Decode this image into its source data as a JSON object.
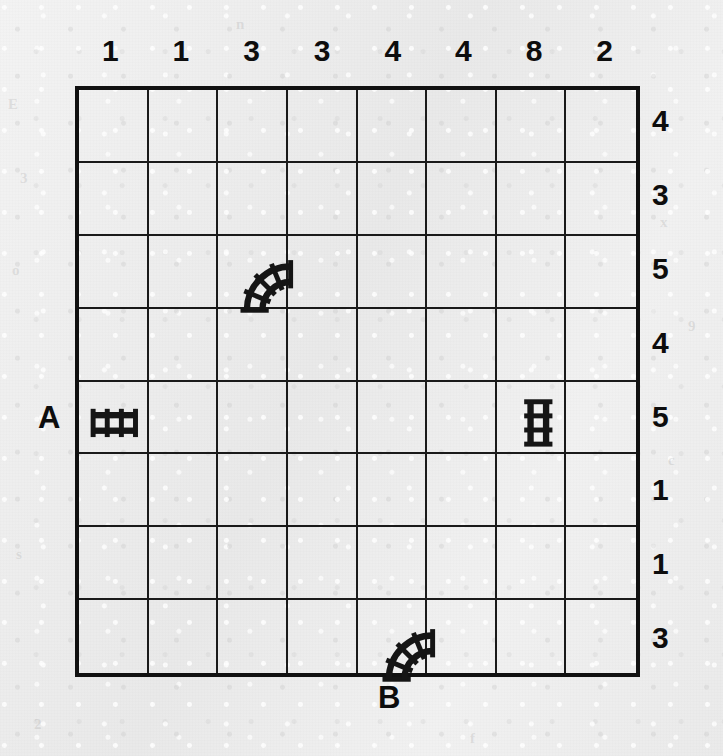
{
  "puzzle": {
    "type": "train-tracks",
    "grid": {
      "rows": 8,
      "cols": 8
    },
    "column_clues": [
      1,
      1,
      3,
      3,
      4,
      4,
      8,
      2
    ],
    "row_clues": [
      4,
      3,
      5,
      4,
      5,
      1,
      1,
      3
    ],
    "entry_labels": [
      {
        "id": "A",
        "text": "A",
        "side": "left",
        "row": 5
      },
      {
        "id": "B",
        "text": "B",
        "side": "bottom",
        "col": 5
      }
    ],
    "given_tracks": [
      {
        "row": 3,
        "col": 3,
        "kind": "curve",
        "connects": [
          "right",
          "bottom"
        ]
      },
      {
        "row": 5,
        "col": 1,
        "kind": "straight",
        "connects": [
          "left",
          "right"
        ],
        "orientation": "horizontal"
      },
      {
        "row": 5,
        "col": 7,
        "kind": "straight",
        "connects": [
          "top",
          "bottom"
        ],
        "orientation": "vertical"
      },
      {
        "row": 8,
        "col": 5,
        "kind": "curve",
        "connects": [
          "right",
          "bottom"
        ]
      }
    ],
    "colors": {
      "paper": "#eeeeee",
      "ink": "#111111",
      "gridline": "#1a1a1a",
      "track": "#151515"
    },
    "ghost_marks": [
      {
        "text": "E",
        "x": 8,
        "y": 96
      },
      {
        "text": "3",
        "x": 20,
        "y": 170
      },
      {
        "text": "o",
        "x": 12,
        "y": 262
      },
      {
        "text": "x",
        "x": 660,
        "y": 214
      },
      {
        "text": "9",
        "x": 688,
        "y": 318
      },
      {
        "text": "c",
        "x": 668,
        "y": 452
      },
      {
        "text": "s",
        "x": 16,
        "y": 546
      },
      {
        "text": "2",
        "x": 34,
        "y": 716
      },
      {
        "text": "f",
        "x": 470,
        "y": 730
      },
      {
        "text": "n",
        "x": 236,
        "y": 16
      }
    ]
  }
}
